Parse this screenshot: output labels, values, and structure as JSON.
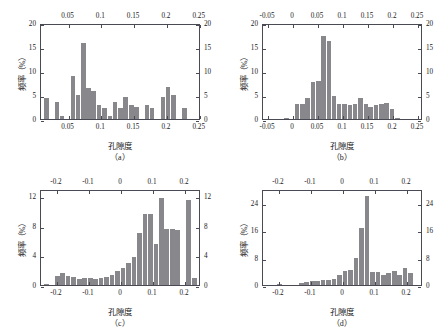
{
  "figure": {
    "panels": [
      {
        "id": "a",
        "caption": "（a）",
        "xlabel": "孔隙度",
        "ylabel": "频率（%）",
        "xticks_top": [
          "0",
          "0.05",
          "0.1",
          "0.15",
          "0.2",
          "0.25"
        ],
        "xticks_bottom": [
          "0.05",
          "0.1",
          "0.15",
          "0.2",
          "0.25"
        ],
        "yticks_left": [
          "0",
          "5",
          "10",
          "15",
          "20"
        ],
        "yticks_right": [
          "0",
          "5",
          "10",
          "15",
          "20"
        ]
      },
      {
        "id": "b",
        "caption": "（b）",
        "xlabel": "孔隙度",
        "ylabel": "频率（%）",
        "xticks_top": [
          "-0.05",
          "0",
          "0.05",
          "0.1",
          "0.15",
          "0.2",
          "0.25"
        ],
        "xticks_bottom": [
          "-0.05",
          "0",
          "0.05",
          "0.1",
          "0.15",
          "0.2",
          "0.25"
        ],
        "yticks_left": [
          "0",
          "5",
          "10",
          "15",
          "20"
        ],
        "yticks_right": [
          "0",
          "5",
          "10",
          "15",
          "20"
        ]
      },
      {
        "id": "c",
        "caption": "（c）",
        "xlabel": "孔隙度",
        "ylabel": "频率（%）",
        "xticks_top": [
          "-0.2",
          "-0.1",
          "0",
          "0.1",
          "0.2"
        ],
        "xticks_bottom": [
          "-0.2",
          "-0.1",
          "0",
          "0.1",
          "0.2"
        ],
        "yticks_left": [
          "0",
          "4",
          "8",
          "12"
        ],
        "yticks_right": [
          "0",
          "4",
          "8",
          "12"
        ]
      },
      {
        "id": "d",
        "caption": "（d）",
        "xlabel": "孔隙度",
        "ylabel": "频率（%）",
        "xticks_top": [
          "-0.2",
          "-0.1",
          "0",
          "0.1",
          "0.2"
        ],
        "xticks_bottom": [
          "-0.2",
          "-0.1",
          "0",
          "0.1",
          "0.2"
        ],
        "yticks_left": [
          "0",
          "8",
          "16",
          "24"
        ],
        "yticks_right": [
          "0",
          "8",
          "16",
          "24"
        ]
      }
    ],
    "colors": {
      "bar": "#87878c",
      "axis": "#4a4a55",
      "text": "#1a1a1a",
      "background": "#ffffff"
    }
  },
  "chart_data": [
    {
      "type": "bar",
      "panel": "a",
      "title": "",
      "xlabel": "孔隙度",
      "ylabel": "频率（%）",
      "xlim": [
        0.008,
        0.252
      ],
      "ylim": [
        0,
        20
      ],
      "ytick_values": [
        0,
        5,
        10,
        15,
        20
      ],
      "xtick_values_top": [
        0,
        0.05,
        0.1,
        0.15,
        0.2,
        0.25
      ],
      "xtick_values_bottom": [
        0.05,
        0.1,
        0.15,
        0.2,
        0.25
      ],
      "grid": false,
      "legend": null,
      "bin_width": 0.0082,
      "x": [
        0.017,
        0.025,
        0.033,
        0.041,
        0.049,
        0.058,
        0.066,
        0.074,
        0.082,
        0.09,
        0.098,
        0.107,
        0.115,
        0.123,
        0.131,
        0.139,
        0.148,
        0.156,
        0.164,
        0.172,
        0.18,
        0.189,
        0.197,
        0.205,
        0.213,
        0.221,
        0.23,
        0.238
      ],
      "values": [
        4.4,
        0.0,
        3.7,
        0.6,
        0.0,
        9.2,
        5.2,
        16.2,
        6.7,
        6.0,
        2.9,
        2.3,
        0.7,
        3.7,
        2.4,
        4.7,
        3.0,
        2.6,
        0.0,
        3.0,
        2.3,
        0.0,
        4.7,
        6.8,
        5.2,
        0.0,
        2.4,
        0.0
      ]
    },
    {
      "type": "bar",
      "panel": "b",
      "title": "",
      "xlabel": "孔隙度",
      "ylabel": "频率（%）",
      "xlim": [
        -0.06,
        0.26
      ],
      "ylim": [
        0,
        20
      ],
      "ytick_values": [
        0,
        5,
        10,
        15,
        20
      ],
      "xtick_values_top": [
        -0.05,
        0,
        0.05,
        0.1,
        0.15,
        0.2,
        0.25
      ],
      "xtick_values_bottom": [
        -0.05,
        0,
        0.05,
        0.1,
        0.15,
        0.2,
        0.25
      ],
      "grid": false,
      "legend": null,
      "bin_width": 0.0107,
      "x": [
        -0.012,
        -0.001,
        0.01,
        0.021,
        0.031,
        0.042,
        0.053,
        0.063,
        0.074,
        0.085,
        0.095,
        0.106,
        0.117,
        0.127,
        0.138,
        0.149,
        0.159,
        0.17,
        0.181,
        0.191,
        0.202,
        0.213,
        0.223,
        0.234
      ],
      "values": [
        0.3,
        0.0,
        3.3,
        3.2,
        4.5,
        7.8,
        8.0,
        17.6,
        16.7,
        4.9,
        3.2,
        3.1,
        2.9,
        3.3,
        4.5,
        3.3,
        2.6,
        3.0,
        3.1,
        3.5,
        2.1,
        0.3,
        0.0,
        0.0
      ]
    },
    {
      "type": "bar",
      "panel": "c",
      "title": "",
      "xlabel": "孔隙度",
      "ylabel": "频率（%）",
      "xlim": [
        -0.25,
        0.25
      ],
      "ylim": [
        0,
        13
      ],
      "ytick_values": [
        0,
        4,
        8,
        12
      ],
      "xtick_values_top": [
        -0.2,
        -0.1,
        0,
        0.1,
        0.2
      ],
      "xtick_values_bottom": [
        -0.2,
        -0.1,
        0,
        0.1,
        0.2
      ],
      "grid": false,
      "legend": null,
      "bin_width": 0.0172,
      "x": [
        -0.232,
        -0.215,
        -0.197,
        -0.18,
        -0.163,
        -0.145,
        -0.128,
        -0.111,
        -0.093,
        -0.076,
        -0.059,
        -0.041,
        -0.024,
        -0.007,
        0.011,
        0.028,
        0.045,
        0.063,
        0.08,
        0.097,
        0.115,
        0.132,
        0.149,
        0.167,
        0.184,
        0.201,
        0.219,
        0.236
      ],
      "values": [
        0.2,
        0.0,
        1.3,
        1.6,
        1.2,
        1.1,
        0.9,
        1.0,
        1.0,
        0.9,
        1.0,
        1.1,
        1.4,
        1.9,
        2.4,
        3.0,
        3.9,
        7.2,
        9.8,
        9.8,
        5.7,
        12.0,
        7.8,
        7.7,
        7.6,
        0.0,
        11.7,
        1.0
      ]
    },
    {
      "type": "bar",
      "panel": "d",
      "title": "",
      "xlabel": "孔隙度",
      "ylabel": "频率（%）",
      "xlim": [
        -0.25,
        0.25
      ],
      "ylim": [
        0,
        28
      ],
      "ytick_values": [
        0,
        8,
        16,
        24
      ],
      "xtick_values_top": [
        -0.2,
        -0.1,
        0,
        0.1,
        0.2
      ],
      "xtick_values_bottom": [
        -0.2,
        -0.1,
        0,
        0.1,
        0.2
      ],
      "grid": false,
      "legend": null,
      "bin_width": 0.0172,
      "x": [
        -0.232,
        -0.215,
        -0.197,
        -0.18,
        -0.163,
        -0.145,
        -0.128,
        -0.111,
        -0.093,
        -0.076,
        -0.059,
        -0.041,
        -0.024,
        -0.007,
        0.011,
        0.028,
        0.045,
        0.063,
        0.08,
        0.097,
        0.115,
        0.132,
        0.149,
        0.167,
        0.184,
        0.201,
        0.219,
        0.236
      ],
      "values": [
        0.0,
        0.0,
        0.2,
        0.0,
        0.0,
        0.0,
        0.5,
        0.9,
        1.2,
        1.3,
        1.5,
        1.6,
        1.8,
        3.1,
        4.3,
        4.5,
        8.1,
        17.0,
        26.4,
        4.0,
        3.8,
        3.0,
        3.7,
        4.2,
        2.9,
        5.1,
        3.6,
        0.0
      ]
    }
  ]
}
